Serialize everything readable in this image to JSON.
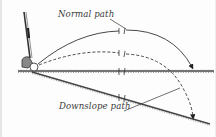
{
  "diagram": {
    "labels": {
      "normal_path": "Normal path",
      "downslope_path": "Downslope path"
    },
    "elements": [
      "golf club",
      "golf ball",
      "flat ground line",
      "downslope ground line",
      "normal path trajectory (solid, arrow lands on flat ground)",
      "downslope path trajectory (dashed, arrow lands on downslope)"
    ],
    "colors": {
      "ink": "#3a3a3a",
      "background": "#fdfdfd",
      "grass": "#555555"
    }
  }
}
